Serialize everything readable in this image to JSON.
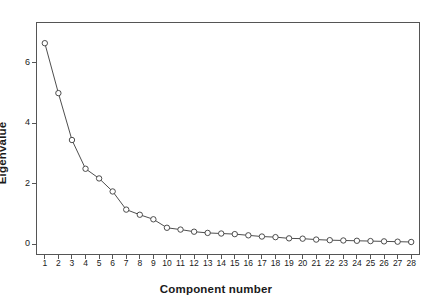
{
  "chart_data": {
    "type": "line",
    "title": "",
    "subtitle": "",
    "xlabel": "Component number",
    "ylabel": "Eigenvalue",
    "x": [
      1,
      2,
      3,
      4,
      5,
      6,
      7,
      8,
      9,
      10,
      11,
      12,
      13,
      14,
      15,
      16,
      17,
      18,
      19,
      20,
      21,
      22,
      23,
      24,
      25,
      26,
      27,
      28
    ],
    "categories": [
      "1",
      "2",
      "3",
      "4",
      "5",
      "6",
      "7",
      "8",
      "9",
      "10",
      "11",
      "12",
      "13",
      "14",
      "15",
      "16",
      "17",
      "18",
      "19",
      "20",
      "21",
      "22",
      "23",
      "24",
      "25",
      "26",
      "27",
      "28"
    ],
    "values": [
      6.65,
      5.0,
      3.45,
      2.5,
      2.18,
      1.75,
      1.15,
      0.98,
      0.83,
      0.55,
      0.49,
      0.42,
      0.38,
      0.36,
      0.34,
      0.3,
      0.26,
      0.24,
      0.2,
      0.19,
      0.16,
      0.14,
      0.13,
      0.12,
      0.11,
      0.1,
      0.09,
      0.08
    ],
    "series": [
      {
        "name": "Eigenvalue",
        "values": [
          6.65,
          5.0,
          3.45,
          2.5,
          2.18,
          1.75,
          1.15,
          0.98,
          0.83,
          0.55,
          0.49,
          0.42,
          0.38,
          0.36,
          0.34,
          0.3,
          0.26,
          0.24,
          0.2,
          0.19,
          0.16,
          0.14,
          0.13,
          0.12,
          0.11,
          0.1,
          0.09,
          0.08
        ]
      }
    ],
    "xlim": [
      0.35,
      28.65
    ],
    "ylim": [
      -0.35,
      7.35
    ],
    "yticks": [
      0,
      2,
      4,
      6
    ],
    "ytick_labels": [
      "0",
      "2",
      "4",
      "6"
    ],
    "xticks": [
      1,
      2,
      3,
      4,
      5,
      6,
      7,
      8,
      9,
      10,
      11,
      12,
      13,
      14,
      15,
      16,
      17,
      18,
      19,
      20,
      21,
      22,
      23,
      24,
      25,
      26,
      27,
      28
    ],
    "grid": false,
    "legend": false,
    "legend_position": "none",
    "marker": "open-circle",
    "line_color": "#3a3a3a",
    "marker_edge_color": "#3a3a3a",
    "marker_face_color": "#ffffff",
    "frame_color": "#555555",
    "background_color": "#ffffff"
  }
}
